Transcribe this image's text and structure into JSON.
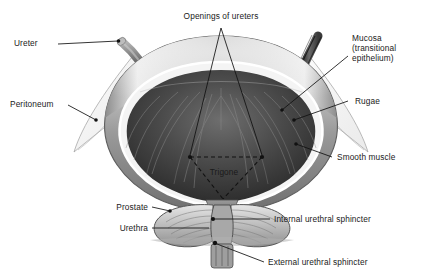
{
  "diagram": {
    "background_color": "#ffffff",
    "text_color": "#1a1a1a",
    "leader_color": "#111111"
  },
  "labels": {
    "ureter": "Ureter",
    "peritoneum": "Peritoneum",
    "openings_of_ureters": "Openings of ureters",
    "mucosa_line1": "Mucosa",
    "mucosa_line2": "(transitional",
    "mucosa_line3": "epithelium)",
    "rugae": "Rugae",
    "smooth_muscle": "Smooth muscle",
    "trigone": "Trigone",
    "prostate": "Prostate",
    "urethra": "Urethra",
    "internal_urethral_sphincter": "Internal urethral sphincter",
    "external_urethral_sphincter": "External urethral sphincter"
  },
  "structures": {
    "bladder_wall": "bladder-wall",
    "bladder_lumen": "bladder-lumen",
    "rugae_folds": "rugae-folds",
    "left_ureter_tube": "left-ureter-tube",
    "right_ureter_tube": "right-ureter-tube",
    "left_peritoneum_flap": "left-peritoneum-flap",
    "right_peritoneum_flap": "right-peritoneum-flap",
    "trigone_triangle": "trigone-dashed-triangle",
    "prostate_gland": "prostate-gland",
    "urethra_tube": "urethra-tube",
    "internal_sphincter_marker": "internal-sphincter-marker",
    "external_sphincter_marker": "external-sphincter-marker"
  },
  "colors": {
    "wall_outer": "#d9d9d9",
    "wall_muscle": "#8c8c8c",
    "mucosa_line": "#f2f2f2",
    "lumen_dark": "#3a3a3a",
    "lumen_deep": "#2a2a2a",
    "prostate_fill": "#b9b9b9",
    "ureter_grey": "#7a7a7a"
  }
}
